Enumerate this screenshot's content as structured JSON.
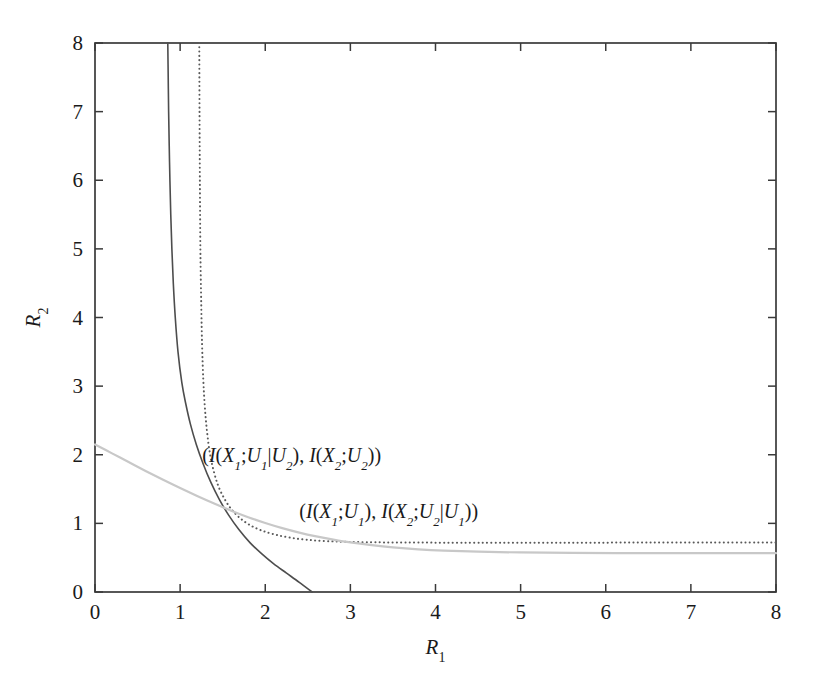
{
  "chart_data": {
    "type": "line",
    "title": "",
    "xlabel": "R_1",
    "ylabel": "R_2",
    "xlabel_base": "R",
    "xlabel_sub": "1",
    "ylabel_base": "R",
    "ylabel_sub": "2",
    "xlim": [
      0,
      8
    ],
    "ylim": [
      0,
      8
    ],
    "xticks": [
      0,
      1,
      2,
      3,
      4,
      5,
      6,
      7,
      8
    ],
    "yticks": [
      0,
      1,
      2,
      3,
      4,
      5,
      6,
      7,
      8
    ],
    "xtick_labels": [
      "0",
      "1",
      "2",
      "3",
      "4",
      "5",
      "6",
      "7",
      "8"
    ],
    "ytick_labels": [
      "0",
      "1",
      "2",
      "3",
      "4",
      "5",
      "6",
      "7",
      "8"
    ],
    "grid": false,
    "legend": "none",
    "annotations": [
      {
        "id": "annotation-upper",
        "text": "(I(X1;U1|U2), I(X2;U2))",
        "parts": [
          {
            "t": "(",
            "sub": false,
            "roman": true
          },
          {
            "t": "I",
            "sub": false
          },
          {
            "t": "(",
            "sub": false,
            "roman": true
          },
          {
            "t": "X",
            "sub": false
          },
          {
            "t": "1",
            "sub": true
          },
          {
            "t": ";",
            "sub": false,
            "roman": true
          },
          {
            "t": "U",
            "sub": false
          },
          {
            "t": "1",
            "sub": true
          },
          {
            "t": "|",
            "sub": false,
            "roman": true
          },
          {
            "t": "U",
            "sub": false
          },
          {
            "t": "2",
            "sub": true
          },
          {
            "t": "), ",
            "sub": false,
            "roman": true
          },
          {
            "t": "I",
            "sub": false
          },
          {
            "t": "(",
            "sub": false,
            "roman": true
          },
          {
            "t": "X",
            "sub": false
          },
          {
            "t": "2",
            "sub": true
          },
          {
            "t": ";",
            "sub": false,
            "roman": true
          },
          {
            "t": "U",
            "sub": false
          },
          {
            "t": "2",
            "sub": true
          },
          {
            "t": "))",
            "sub": false,
            "roman": true
          }
        ],
        "x": 1.26,
        "y": 1.9
      },
      {
        "id": "annotation-lower",
        "text": "(I(X1;U1), I(X2;U2|U1))",
        "parts": [
          {
            "t": "(",
            "sub": false,
            "roman": true
          },
          {
            "t": "I",
            "sub": false
          },
          {
            "t": "(",
            "sub": false,
            "roman": true
          },
          {
            "t": "X",
            "sub": false
          },
          {
            "t": "1",
            "sub": true
          },
          {
            "t": ";",
            "sub": false,
            "roman": true
          },
          {
            "t": "U",
            "sub": false
          },
          {
            "t": "1",
            "sub": true
          },
          {
            "t": "), ",
            "sub": false,
            "roman": true
          },
          {
            "t": "I",
            "sub": false
          },
          {
            "t": "(",
            "sub": false,
            "roman": true
          },
          {
            "t": "X",
            "sub": false
          },
          {
            "t": "2",
            "sub": true
          },
          {
            "t": ";",
            "sub": false,
            "roman": true
          },
          {
            "t": "U",
            "sub": false
          },
          {
            "t": "2",
            "sub": true
          },
          {
            "t": "|",
            "sub": false,
            "roman": true
          },
          {
            "t": "U",
            "sub": false
          },
          {
            "t": "1",
            "sub": true
          },
          {
            "t": "))",
            "sub": false,
            "roman": true
          }
        ],
        "x": 2.4,
        "y": 1.08
      }
    ],
    "series": [
      {
        "name": "dark-solid-boundary",
        "style": "solid",
        "color": "#4d4d4d",
        "width": 1.6,
        "vertical_asymptote": 0.85,
        "x_intercept": 2.55,
        "points": [
          [
            0.855,
            8.0
          ],
          [
            0.86,
            7.5
          ],
          [
            0.865,
            7.0
          ],
          [
            0.872,
            6.5
          ],
          [
            0.88,
            6.0
          ],
          [
            0.89,
            5.5
          ],
          [
            0.903,
            5.0
          ],
          [
            0.92,
            4.5
          ],
          [
            0.943,
            4.0
          ],
          [
            0.975,
            3.5
          ],
          [
            1.02,
            3.05
          ],
          [
            1.065,
            2.75
          ],
          [
            1.12,
            2.45
          ],
          [
            1.19,
            2.15
          ],
          [
            1.27,
            1.87
          ],
          [
            1.36,
            1.6
          ],
          [
            1.46,
            1.35
          ],
          [
            1.57,
            1.12
          ],
          [
            1.69,
            0.91
          ],
          [
            1.82,
            0.72
          ],
          [
            1.96,
            0.555
          ],
          [
            2.1,
            0.41
          ],
          [
            2.25,
            0.275
          ],
          [
            2.4,
            0.14
          ],
          [
            2.55,
            0.0
          ]
        ]
      },
      {
        "name": "dotted-boundary",
        "style": "dotted",
        "color": "#5a5a5a",
        "width": 2.0,
        "vertical_asymptote": 1.22,
        "horizontal_asymptote": 0.72,
        "points": [
          [
            1.225,
            8.0
          ],
          [
            1.228,
            7.0
          ],
          [
            1.232,
            6.0
          ],
          [
            1.238,
            5.0
          ],
          [
            1.248,
            4.2
          ],
          [
            1.258,
            3.6
          ],
          [
            1.272,
            3.1
          ],
          [
            1.29,
            2.7
          ],
          [
            1.315,
            2.35
          ],
          [
            1.35,
            2.02
          ],
          [
            1.395,
            1.76
          ],
          [
            1.45,
            1.54
          ],
          [
            1.52,
            1.36
          ],
          [
            1.6,
            1.21
          ],
          [
            1.7,
            1.08
          ],
          [
            1.82,
            0.975
          ],
          [
            1.96,
            0.895
          ],
          [
            2.12,
            0.835
          ],
          [
            2.3,
            0.79
          ],
          [
            2.5,
            0.76
          ],
          [
            2.72,
            0.742
          ],
          [
            2.96,
            0.731
          ],
          [
            3.3,
            0.724
          ],
          [
            3.8,
            0.72
          ],
          [
            4.5,
            0.719
          ],
          [
            5.5,
            0.719
          ],
          [
            6.5,
            0.72
          ],
          [
            7.5,
            0.721
          ],
          [
            8.0,
            0.722
          ]
        ]
      },
      {
        "name": "light-gray-boundary",
        "style": "solid",
        "color": "#c8c8c8",
        "width": 2.2,
        "y_intercept": 2.15,
        "horizontal_asymptote": 0.57,
        "points": [
          [
            0.0,
            2.15
          ],
          [
            0.2,
            2.02
          ],
          [
            0.4,
            1.89
          ],
          [
            0.6,
            1.76
          ],
          [
            0.8,
            1.635
          ],
          [
            1.0,
            1.515
          ],
          [
            1.2,
            1.4
          ],
          [
            1.4,
            1.29
          ],
          [
            1.6,
            1.185
          ],
          [
            1.8,
            1.09
          ],
          [
            2.0,
            1.005
          ],
          [
            2.2,
            0.93
          ],
          [
            2.4,
            0.865
          ],
          [
            2.6,
            0.81
          ],
          [
            2.8,
            0.763
          ],
          [
            3.0,
            0.722
          ],
          [
            3.25,
            0.682
          ],
          [
            3.5,
            0.65
          ],
          [
            3.8,
            0.622
          ],
          [
            4.1,
            0.603
          ],
          [
            4.5,
            0.587
          ],
          [
            5.0,
            0.576
          ],
          [
            5.6,
            0.57
          ],
          [
            6.4,
            0.567
          ],
          [
            7.2,
            0.566
          ],
          [
            8.0,
            0.566
          ]
        ]
      }
    ]
  },
  "axes": {
    "frame_color": "#3a3a3a",
    "background": "#ffffff"
  }
}
